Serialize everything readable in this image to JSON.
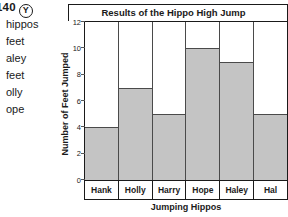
{
  "worksheet": {
    "page_number": "e 140",
    "circled_letter": "Y",
    "margin_lines": [
      "hippos",
      "feet",
      "aley",
      "feet",
      "olly",
      "ope"
    ]
  },
  "chart_data": {
    "type": "bar",
    "title": "Results of the Hippo High Jump",
    "xlabel": "Jumping Hippos",
    "ylabel": "Number of Feet Jumped",
    "categories": [
      "Hank",
      "Holly",
      "Harry",
      "Hope",
      "Haley",
      "Hal"
    ],
    "values": [
      4,
      7,
      5,
      10,
      9,
      5
    ],
    "ylim": [
      0,
      12
    ],
    "yticks": [
      0,
      2,
      4,
      6,
      8,
      10,
      12
    ],
    "grid": false,
    "legend": null,
    "bar_color": "#c4c4c4",
    "bar_edge_color": "#4a4a4a",
    "axis_color": "#1a1a1a"
  }
}
